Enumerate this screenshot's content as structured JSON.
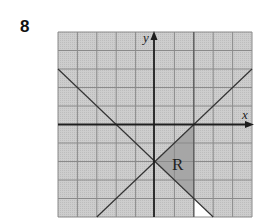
{
  "question": {
    "number": "8"
  },
  "graph": {
    "x_axis_label": "x",
    "y_axis_label": "y",
    "region_label": "R",
    "x_range": [
      -5,
      5
    ],
    "y_range": [
      -5,
      5
    ],
    "grid_step": 1,
    "lines": [
      {
        "name": "line-descending",
        "equation": "y = -x - 2"
      },
      {
        "name": "line-ascending",
        "equation": "y = x - 2"
      },
      {
        "name": "line-vertical",
        "equation": "x = 2"
      }
    ],
    "region_vertices": [
      [
        0,
        -2
      ],
      [
        2,
        0
      ],
      [
        2,
        -4
      ]
    ],
    "colors": {
      "grid_background": "#c9c9c9",
      "grid_lines": "#8a8a8a",
      "axes": "#1e1e1e",
      "region_fill": "#a6a6a6",
      "unshaded_fill": "#ffffff"
    }
  }
}
